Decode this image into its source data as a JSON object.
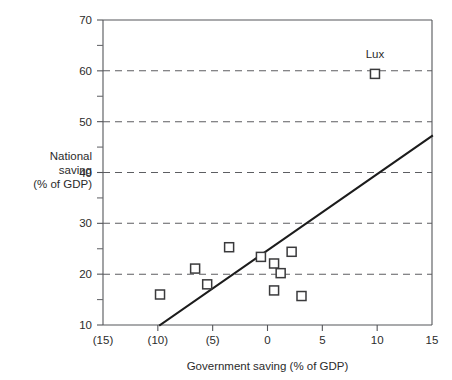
{
  "chart_data": {
    "type": "scatter",
    "title": "",
    "xlabel": "Government saving (% of GDP)",
    "ylabel": "National saving (% of GDP)",
    "ylabel_lines": [
      "National",
      "saving",
      "(% of GDP)"
    ],
    "xlim": [
      -15,
      15
    ],
    "ylim": [
      10,
      70
    ],
    "x_ticks": [
      -15,
      -10,
      -5,
      0,
      5,
      10,
      15
    ],
    "x_tick_labels": [
      "(15)",
      "(10)",
      "(5)",
      "0",
      "5",
      "10",
      "15"
    ],
    "y_ticks": [
      10,
      20,
      30,
      40,
      50,
      60,
      70
    ],
    "y_tick_labels": [
      "10",
      "20",
      "30",
      "40",
      "50",
      "60",
      "70"
    ],
    "y_minor_ticks": [
      15,
      25,
      35,
      45,
      55,
      65
    ],
    "grid": "horizontal-dashed",
    "gridlines_at": [
      20,
      30,
      40,
      50,
      60
    ],
    "legend": "none",
    "points": [
      {
        "x": -9.8,
        "y": 16.0,
        "label": ""
      },
      {
        "x": -6.6,
        "y": 21.1,
        "label": ""
      },
      {
        "x": -5.5,
        "y": 18.0,
        "label": ""
      },
      {
        "x": -3.5,
        "y": 25.3,
        "label": ""
      },
      {
        "x": -0.6,
        "y": 23.4,
        "label": ""
      },
      {
        "x": 0.6,
        "y": 22.1,
        "label": ""
      },
      {
        "x": 0.6,
        "y": 16.8,
        "label": ""
      },
      {
        "x": 1.2,
        "y": 20.2,
        "label": ""
      },
      {
        "x": 2.2,
        "y": 24.4,
        "label": ""
      },
      {
        "x": 3.1,
        "y": 15.7,
        "label": ""
      },
      {
        "x": 9.8,
        "y": 59.4,
        "label": "Lux"
      }
    ],
    "trend_line": {
      "x_start": -9.8,
      "y_start": 10.0,
      "x_end": 15.0,
      "y_end": 47.2
    },
    "annotations": [
      {
        "text": "Lux",
        "x": 9.8,
        "y": 62.5
      }
    ],
    "colors": {
      "axis": "#55565a",
      "grid": "#5d5e62",
      "marker_stroke": "#3a3a3c",
      "marker_fill": "#ffffff",
      "trend": "#1c1c1c",
      "text": "#2b2b2b",
      "background": "#ffffff"
    }
  }
}
